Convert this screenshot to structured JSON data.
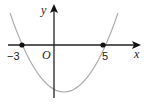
{
  "diagram": {
    "type": "parabola-graph",
    "axes": {
      "x_label": "x",
      "y_label": "y",
      "origin_label": "O"
    },
    "roots": [
      {
        "value": -3,
        "label": "−3"
      },
      {
        "value": 5,
        "label": "5"
      }
    ],
    "curve": {
      "description": "upward-opening parabola through (-3,0) and (5,0)",
      "vertex_x": 1,
      "color": "#aaaaaa"
    },
    "colors": {
      "axis": "#222222",
      "curve": "#aaaaaa",
      "point": "#111111"
    }
  }
}
